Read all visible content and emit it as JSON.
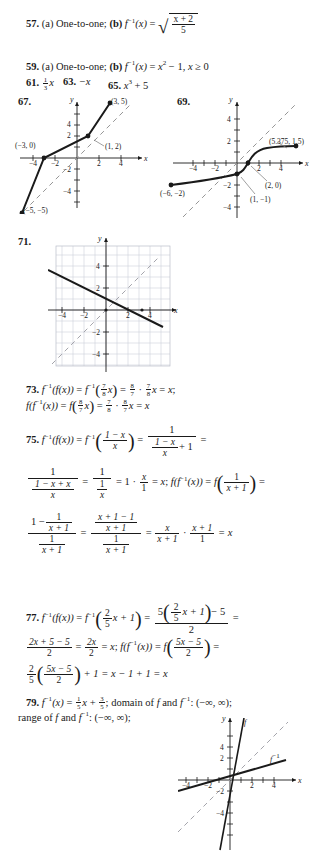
{
  "page": {
    "kind": "textbook-answer-key-page"
  },
  "answers": [
    {
      "number": "57.",
      "parts": [
        "(a) One-to-one;",
        "(b)"
      ],
      "expr_a": "(a) One-to-one;",
      "expr_b_lead": "(b) f",
      "expr_b_inv": "−1",
      "expr_b_rest": "(x) =",
      "radicand_top": "x + 2",
      "radicand_bottom": "5"
    },
    {
      "number": "59.",
      "expr_a": "(a) One-to-one;",
      "expr_b": "(b) f⁻¹(x) = x² − 1, x ≥ 0"
    },
    {
      "number": "61.",
      "expr": "⅓x",
      "frac_top": "1",
      "frac_bottom": "3",
      "var": "x"
    },
    {
      "number": "63.",
      "expr": "−x"
    },
    {
      "number": "65.",
      "expr": "x³ + 5"
    },
    {
      "number": "67.",
      "expr": ""
    },
    {
      "number": "69.",
      "expr": ""
    },
    {
      "number": "71.",
      "expr": ""
    }
  ],
  "graph67": {
    "label": "67.",
    "axis_x": "x",
    "axis_y": "y",
    "xticks": [
      "−4",
      "−2",
      "2",
      "4"
    ],
    "yticks": [
      "4",
      "2",
      "−2",
      "−4"
    ],
    "points": [
      {
        "label": "(3, 5)",
        "x": 3,
        "y": 5
      },
      {
        "label": "(1, 2)",
        "x": 1,
        "y": 2
      },
      {
        "label": "(−3, 0)",
        "x": -3,
        "y": 0
      },
      {
        "label": "(−5, −5)",
        "x": -5,
        "y": -5
      }
    ],
    "dashed_line": "y = x",
    "xrange": [
      -6,
      5
    ],
    "yrange": [
      -5.5,
      5.5
    ]
  },
  "graph69": {
    "label": "69.",
    "axis_x": "x",
    "axis_y": "y",
    "xticks": [
      "−4",
      "−2",
      "2",
      "4"
    ],
    "yticks": [
      "4",
      "2",
      "−2",
      "−4"
    ],
    "points": [
      {
        "label": "(5.375, 1.5)",
        "x": 5.375,
        "y": 1.5
      },
      {
        "label": "(2, 0)",
        "x": 2,
        "y": 0
      },
      {
        "label": "(1, −1)",
        "x": 1,
        "y": -1
      },
      {
        "label": "(−6, −2)",
        "x": -6,
        "y": -2
      }
    ],
    "dashed_line": "y = x",
    "xrange": [
      -7,
      6
    ],
    "yrange": [
      -5,
      5.5
    ]
  },
  "graph71": {
    "label": "71.",
    "axis_x": "x",
    "axis_y": "y",
    "xticks": [
      "−4",
      "−2",
      "2",
      "4"
    ],
    "yticks": [
      "4",
      "2",
      "−2",
      "−4"
    ],
    "grid": true,
    "solid_line": "decreasing line through (0, 2)",
    "dashed_line": "y = x",
    "xrange": [
      -5.5,
      5.5
    ],
    "yrange": [
      -5.5,
      5.5
    ]
  },
  "graph79": {
    "axis_x": "x",
    "axis_y": "y",
    "xticks": [
      "−4",
      "−2",
      "2",
      "4"
    ],
    "yticks": [
      "4",
      "2",
      "−2",
      "−4"
    ],
    "curve_labels": [
      "f",
      "f⁻¹"
    ],
    "label_f": "f",
    "label_finv_base": "f",
    "label_finv_sup": "−1",
    "dashed_line": "y = x",
    "xrange": [
      -5.5,
      5.5
    ],
    "yrange": [
      -5.5,
      5.5
    ]
  },
  "answer73": {
    "number": "73.",
    "line1": "f⁻¹(f(x)) = f⁻¹(7/8 x) = 8/7 · 7/8 x = x;",
    "line2": "f(f⁻¹(x)) = f(8/7 x) = 7/8 · 8/7 x = x",
    "f1": {
      "t": "7",
      "b": "8"
    },
    "f2": {
      "t": "8",
      "b": "7"
    },
    "f3": {
      "t": "7",
      "b": "8"
    },
    "f4": {
      "t": "8",
      "b": "7"
    },
    "f5": {
      "t": "7",
      "b": "8"
    },
    "f6": {
      "t": "8",
      "b": "7"
    }
  },
  "answer75": {
    "number": "75.",
    "lead": "f⁻¹(f(x)) = f⁻¹",
    "arg_top": "1 − x",
    "arg_bottom": "x",
    "eq1_num": "1",
    "eq1_den_top": "1 − x",
    "eq1_den_bottom": "x",
    "eq1_den_plus": "+ 1",
    "l2_f1_top": "1",
    "l2_f1_den_top": "1 − x + x",
    "l2_f1_den_bottom": "x",
    "l2_f2_top": "1",
    "l2_f2_den_top": "1",
    "l2_f2_den_bottom": "x",
    "l2_mid": "= 1 ·",
    "l2_f3_top": "x",
    "l2_f3_bottom": "1",
    "l2_tail": "= x; f(f⁻¹(x)) = f",
    "l2_f4_top": "1",
    "l2_f4_bottom": "x + 1",
    "l3_num_lead": "1 −",
    "l3_num_f_top": "1",
    "l3_num_f_bottom": "x + 1",
    "l3_den_top": "1",
    "l3_den_bottom": "x + 1",
    "l3_b_num_top": "x + 1 − 1",
    "l3_b_num_bottom": "x + 1",
    "l3_b_den_top": "1",
    "l3_b_den_bottom": "x + 1",
    "l3_c_top": "x",
    "l3_c_bottom": "x + 1",
    "l3_d_top": "x + 1",
    "l3_d_bottom": "1",
    "l3_end": "= x"
  },
  "answer77": {
    "number": "77.",
    "lead": "f⁻¹(f(x)) = f⁻¹",
    "arg_f_top": "2",
    "arg_f_bottom": "5",
    "arg_rest": "x + 1",
    "rhs_num_lead": "5",
    "rhs_inner_top": "2",
    "rhs_inner_bottom": "5",
    "rhs_inner_rest": "x + 1",
    "rhs_minus": "− 5",
    "rhs_den": "2",
    "l2_a_top": "2x + 5 − 5",
    "l2_a_bottom": "2",
    "l2_b_top": "2x",
    "l2_b_bottom": "2",
    "l2_mid": "= x; f(f⁻¹(x)) = f",
    "l2_c_top": "5x − 5",
    "l2_c_bottom": "2",
    "l3_a_top": "2",
    "l3_a_bottom": "5",
    "l3_b_top": "5x − 5",
    "l3_b_bottom": "2",
    "l3_end": "+ 1 = x − 1 + 1 = x"
  },
  "answer79": {
    "number": "79.",
    "line1_lead": "f⁻¹(x) =",
    "f1_top": "1",
    "f1_bottom": "5",
    "mid": "x +",
    "f2_top": "3",
    "f2_bottom": "5",
    "line1_tail": "; domain of f and f⁻¹: (−∞, ∞);",
    "line2": "range of f and f⁻¹: (−∞, ∞);"
  },
  "colors": {
    "ink": "#1a1a1a",
    "grid": "#c9ccd6",
    "dashed": "#8a8a8a",
    "leader": "#777777"
  }
}
